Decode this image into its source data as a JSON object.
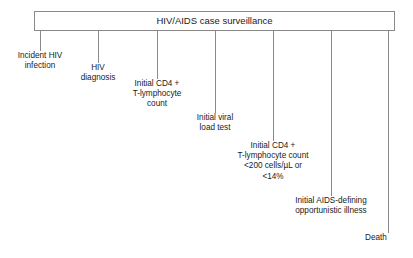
{
  "diagram": {
    "title": "HIV/AIDS case surveillance",
    "surveillance_bar": {
      "label": "HIV/AIDS case surveillance"
    },
    "events": [
      {
        "id": "incident-hiv-infection",
        "label": "Incident HIV\ninfection",
        "tick_x": 40,
        "tick_top": 31,
        "tick_bottom": 51,
        "text_left": 2,
        "text_top": 51,
        "text_width": 76,
        "align": "center"
      },
      {
        "id": "hiv-diagnosis",
        "label": "HIV\ndiagnosis",
        "tick_x": 98,
        "tick_top": 31,
        "tick_bottom": 63,
        "text_left": 67,
        "text_top": 63,
        "text_width": 62,
        "align": "center"
      },
      {
        "id": "initial-cd4-t-lymphocyte-count",
        "label": "Initial CD4 +\nT-lymphocyte\ncount",
        "tick_x": 157,
        "tick_top": 31,
        "tick_bottom": 79,
        "text_left": 122,
        "text_top": 79,
        "text_width": 70,
        "align": "center"
      },
      {
        "id": "initial-viral-load-test",
        "label": "Initial viral\nload test",
        "tick_x": 215,
        "tick_top": 31,
        "tick_bottom": 113,
        "text_left": 185,
        "text_top": 113,
        "text_width": 60,
        "align": "center"
      },
      {
        "id": "initial-cd4-below-200",
        "label": "Initial CD4 +\nT-lymphocyte count\n<200 cells/µL or\n<14%",
        "tick_x": 273,
        "tick_top": 31,
        "tick_bottom": 141,
        "text_left": 220,
        "text_top": 141,
        "text_width": 106,
        "align": "center"
      },
      {
        "id": "initial-aids-defining-illness",
        "label": "Initial AIDS-defining\nopportunistic illness",
        "tick_x": 331,
        "tick_top": 31,
        "tick_bottom": 196,
        "text_left": 278,
        "text_top": 196,
        "text_width": 106,
        "align": "center"
      },
      {
        "id": "death",
        "label": "Death",
        "tick_x": 388,
        "tick_top": 31,
        "tick_bottom": 233,
        "text_left": 344,
        "text_top": 233,
        "text_width": 64,
        "align": "center"
      }
    ],
    "colors": {
      "line": "#8a8a8a",
      "text": "#1a1a1a",
      "background": "#ffffff"
    }
  }
}
